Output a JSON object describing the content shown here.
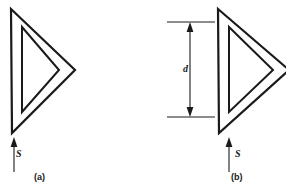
{
  "figure": {
    "background_color": "#ffffff",
    "line_color": "#1a1a1a",
    "panels": [
      {
        "id": "a",
        "caption": "(a)",
        "flow_label": "S",
        "flow_direction": "up",
        "shape": "hollow-triangle-pointing-right",
        "shape_outer_points": "11,9 75,70 12,133",
        "shape_inner_points": "22,27 59,70 22,112",
        "arrow_label": "S",
        "dimension_label": null
      },
      {
        "id": "b",
        "caption": "(b)",
        "flow_label": "S",
        "flow_direction": "up",
        "shape": "hollow-triangle-pointing-right",
        "shape_outer_points": "218,9 288,70 219,133",
        "shape_inner_points": "229,27 272,70 229,112",
        "arrow_label": "S",
        "dimension_label": "d",
        "dimension_top_y": 22,
        "dimension_bottom_y": 117
      }
    ]
  },
  "labels": {
    "caption_a": "(a)",
    "caption_b": "(b)",
    "flow_a": "S",
    "flow_b": "S",
    "dimension_d": "d"
  }
}
